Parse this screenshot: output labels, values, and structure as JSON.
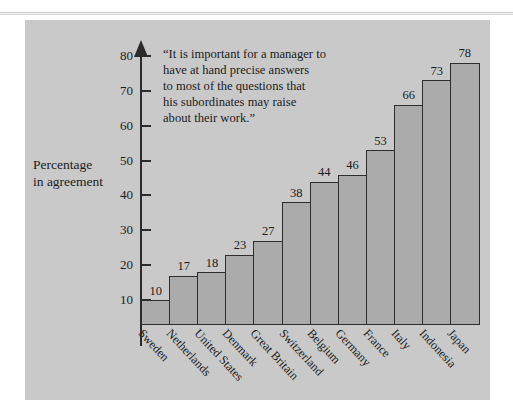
{
  "chart_data": {
    "type": "bar",
    "title": "",
    "quote": "“It is important for a manager to have at hand precise answers to most of the questions that his subordinates may raise about their work.”",
    "quote_lines": [
      "“It is important for a manager to",
      "have at hand precise answers",
      "to most of the questions that",
      "his subordinates may raise",
      "about their work.”"
    ],
    "ylabel_lines": [
      "Percentage",
      "in agreement"
    ],
    "ylabel": "Percentage in agreement",
    "xlabel": "",
    "ylim": [
      0,
      85
    ],
    "yticks": [
      10,
      20,
      30,
      40,
      50,
      60,
      70,
      80
    ],
    "ytick_labels": [
      "10",
      "20",
      "30",
      "40",
      "50",
      "60",
      "70",
      "80"
    ],
    "grid": false,
    "legend": "none",
    "categories": [
      "Sweden",
      "Netherlands",
      "United States",
      "Denmark",
      "Great Britain",
      "Switzerland",
      "Belgium",
      "Germany",
      "France",
      "Italy",
      "Indonesia",
      "Japan"
    ],
    "values": [
      10,
      17,
      18,
      23,
      27,
      38,
      44,
      46,
      53,
      66,
      73,
      78
    ],
    "value_labels": [
      "10",
      "17",
      "18",
      "23",
      "27",
      "38",
      "44",
      "46",
      "53",
      "66",
      "73",
      "78"
    ],
    "colors": {
      "panel_background": "#c9c9c9",
      "bar_fill": "#ababab",
      "bar_edge": "#2e2e2e",
      "axis": "#2b2b2b",
      "text": "#1c1c1c",
      "page_background": "#ffffff"
    }
  }
}
